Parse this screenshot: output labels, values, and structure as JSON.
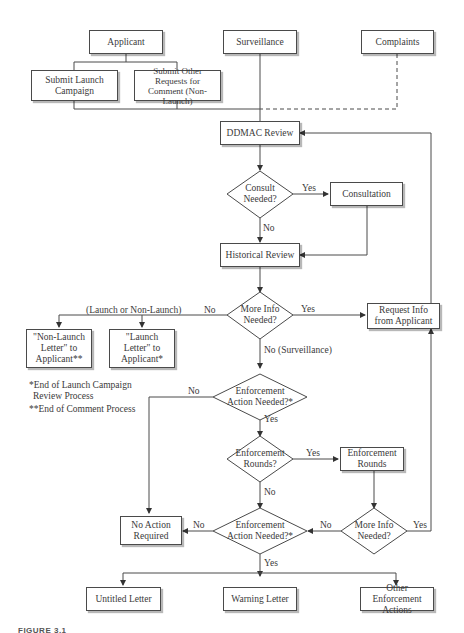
{
  "diagram": {
    "nodes": {
      "applicant": "Applicant",
      "surveillance": "Surveillance",
      "complaints": "Complaints",
      "submit_launch": "Submit Launch Campaign",
      "submit_other": "Submit Other Requests for Comment (Non-Launch)",
      "ddmac_review": "DDMAC Review",
      "consult_needed": "Consult Needed?",
      "consultation": "Consultation",
      "historical_review": "Historical Review",
      "more_info_1": "More Info Needed?",
      "request_info": "Request Info from Applicant",
      "non_launch_letter": "\"Non-Launch Letter\" to Applicant**",
      "launch_letter": "\"Launch Letter\" to Applicant*",
      "enforcement_needed_1": "Enforcement Action Needed?*",
      "enforcement_rounds_q": "Enforcement Rounds?",
      "enforcement_rounds": "Enforcement Rounds",
      "more_info_2": "More Info Needed?",
      "enforcement_needed_2": "Enforcement Action Needed?*",
      "no_action": "No Action Required",
      "untitled_letter": "Untitled Letter",
      "warning_letter": "Warning Letter",
      "other_enforcement": "Other Enforcement Actions"
    },
    "edge_labels": {
      "consult_yes": "Yes",
      "consult_no": "No",
      "more_info_1_yes": "Yes",
      "more_info_1_no": "No",
      "launch_or_non": "(Launch or Non-Launch)",
      "no_surveillance": "No (Surveillance)",
      "enf1_no": "No",
      "enf1_yes": "Yes",
      "rounds_yes": "Yes",
      "rounds_no": "No",
      "more_info_2_no": "No",
      "more_info_2_yes": "Yes",
      "enf2_no": "No",
      "enf2_yes": "Yes"
    },
    "notes": {
      "note1_line1": "*End of Launch Campaign",
      "note1_line2": "Review Process",
      "note2": "**End of Comment Process"
    },
    "caption": "FIGURE 3.1"
  }
}
